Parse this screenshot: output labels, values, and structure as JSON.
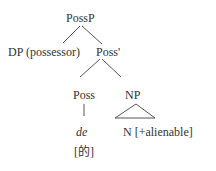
{
  "tree": {
    "root": "PossP",
    "left_child": "DP (possessor)",
    "right_child": "Poss'",
    "poss_head": "Poss",
    "np": "NP",
    "poss_word": "de",
    "poss_gloss": "[的]",
    "np_content": "N [+alienable]"
  }
}
